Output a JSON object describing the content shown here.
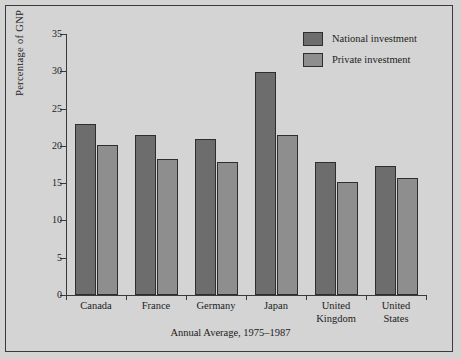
{
  "chart_data": {
    "type": "bar",
    "title": "",
    "xlabel": "Annual Average, 1975–1987",
    "ylabel": "Percentage of GNP",
    "ylim": [
      0,
      35
    ],
    "yticks": [
      0,
      5,
      10,
      15,
      20,
      25,
      30,
      35
    ],
    "grid": false,
    "legend_position": "top-right",
    "categories": [
      "Canada",
      "France",
      "Germany",
      "Japan",
      "United Kingdom",
      "United States"
    ],
    "category_labels": [
      [
        "Canada"
      ],
      [
        "France"
      ],
      [
        "Germany"
      ],
      [
        "Japan"
      ],
      [
        "United",
        "Kingdom"
      ],
      [
        "United",
        "States"
      ]
    ],
    "series": [
      {
        "name": "National investment",
        "color": "#6d6d6d",
        "values": [
          22.9,
          21.5,
          20.9,
          29.9,
          17.9,
          17.3
        ]
      },
      {
        "name": "Private investment",
        "color": "#8e8e8e",
        "values": [
          20.1,
          18.3,
          17.8,
          21.4,
          15.2,
          15.7
        ]
      }
    ]
  },
  "legend": {
    "items": [
      {
        "label": "National investment",
        "swatch": "national"
      },
      {
        "label": "Private investment",
        "swatch": "private"
      }
    ]
  },
  "colors": {
    "background": "#d4d4d4",
    "frame": "#3a3a3a",
    "axis": "#3a3a3a",
    "text": "#1c1c1c",
    "national": "#6d6d6d",
    "private": "#8e8e8e",
    "bar_outline": "#2e2e2e"
  }
}
